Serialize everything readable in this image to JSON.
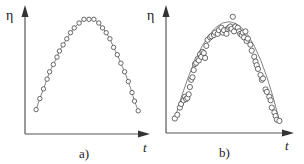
{
  "chart_data": [
    {
      "panel": "a)",
      "type": "line",
      "title": "",
      "xlabel": "t",
      "ylabel": "η",
      "xlim": [
        0,
        1
      ],
      "ylim": [
        0,
        1
      ],
      "grid": false,
      "legend": null,
      "ticks": "none",
      "description": "Smooth parabolic curve with evenly spaced circle markers lying exactly on the line",
      "x": [
        0.09,
        0.12,
        0.15,
        0.18,
        0.2,
        0.23,
        0.26,
        0.28,
        0.31,
        0.34,
        0.37,
        0.4,
        0.44,
        0.48,
        0.52,
        0.56,
        0.6,
        0.63,
        0.66,
        0.69,
        0.72,
        0.75,
        0.78,
        0.81,
        0.84,
        0.87,
        0.89,
        0.92
      ],
      "y": [
        0.2,
        0.29,
        0.37,
        0.45,
        0.51,
        0.57,
        0.63,
        0.68,
        0.73,
        0.78,
        0.83,
        0.87,
        0.91,
        0.94,
        0.94,
        0.94,
        0.91,
        0.87,
        0.83,
        0.78,
        0.71,
        0.65,
        0.58,
        0.51,
        0.43,
        0.34,
        0.27,
        0.19
      ]
    },
    {
      "panel": "b)",
      "type": "scatter",
      "title": "",
      "xlabel": "t",
      "ylabel": "η",
      "xlim": [
        0,
        1
      ],
      "ylim": [
        0,
        1
      ],
      "grid": false,
      "legend": null,
      "ticks": "none",
      "description": "Noisy scatter of open circles around a parabolic fit line",
      "fit": {
        "x": [
          0.07,
          0.5,
          0.9
        ],
        "y": [
          0.12,
          0.92,
          0.1
        ]
      },
      "x": [
        0.07,
        0.09,
        0.11,
        0.12,
        0.14,
        0.15,
        0.16,
        0.17,
        0.18,
        0.19,
        0.2,
        0.21,
        0.22,
        0.23,
        0.24,
        0.25,
        0.26,
        0.27,
        0.28,
        0.29,
        0.3,
        0.31,
        0.32,
        0.33,
        0.35,
        0.36,
        0.38,
        0.39,
        0.41,
        0.42,
        0.44,
        0.45,
        0.46,
        0.48,
        0.49,
        0.5,
        0.51,
        0.52,
        0.53,
        0.54,
        0.55,
        0.57,
        0.58,
        0.59,
        0.6,
        0.61,
        0.62,
        0.63,
        0.64,
        0.65,
        0.67,
        0.68,
        0.7,
        0.71,
        0.72,
        0.73,
        0.75,
        0.76,
        0.77,
        0.79,
        0.8,
        0.82,
        0.83,
        0.84,
        0.86,
        0.87,
        0.88,
        0.9
      ],
      "y": [
        0.12,
        0.15,
        0.21,
        0.24,
        0.27,
        0.3,
        0.28,
        0.29,
        0.32,
        0.38,
        0.44,
        0.46,
        0.52,
        0.57,
        0.58,
        0.61,
        0.6,
        0.65,
        0.63,
        0.67,
        0.66,
        0.62,
        0.72,
        0.77,
        0.79,
        0.8,
        0.81,
        0.83,
        0.82,
        0.85,
        0.87,
        0.83,
        0.85,
        0.82,
        0.86,
        0.87,
        0.88,
        0.86,
        0.96,
        0.84,
        0.88,
        0.87,
        0.84,
        0.82,
        0.81,
        0.83,
        0.79,
        0.84,
        0.76,
        0.78,
        0.73,
        0.68,
        0.63,
        0.59,
        0.56,
        0.53,
        0.48,
        0.44,
        0.45,
        0.36,
        0.34,
        0.3,
        0.27,
        0.21,
        0.17,
        0.14,
        0.11,
        0.1
      ]
    }
  ],
  "labels": {
    "panel_a": "a)",
    "panel_b": "b)",
    "y_axis_a": "η",
    "y_axis_b": "η",
    "x_axis_a": "t",
    "x_axis_b": "t"
  }
}
